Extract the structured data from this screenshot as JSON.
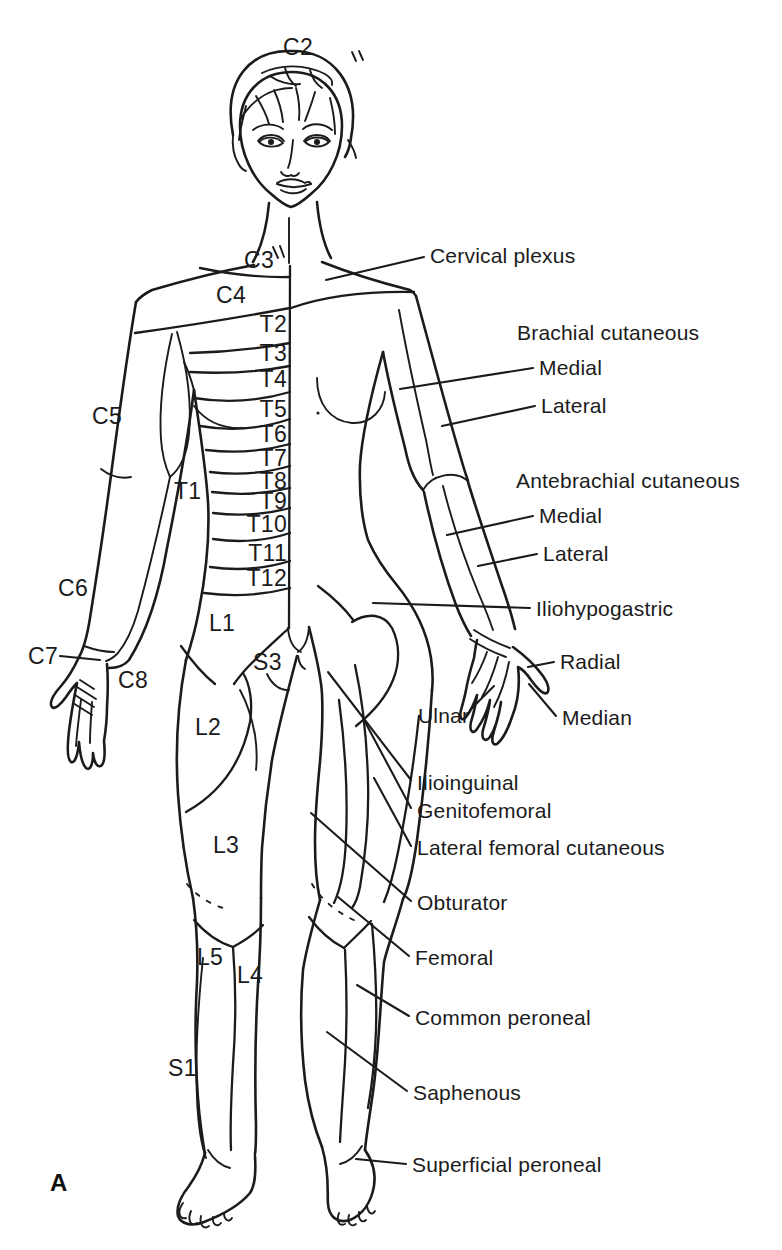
{
  "figure": {
    "panel_letter": "A",
    "dermatomes": {
      "c2": "C2",
      "c3": "C3",
      "c4": "C4",
      "c5": "C5",
      "c6": "C6",
      "c7": "C7",
      "c8": "C8",
      "t1": "T1",
      "t2": "T2",
      "t3": "T3",
      "t4": "T4",
      "t5": "T5",
      "t6": "T6",
      "t7": "T7",
      "t8": "T8",
      "t9": "T9",
      "t10": "T10",
      "t11": "T11",
      "t12": "T12",
      "l1": "L1",
      "l2": "L2",
      "l3": "L3",
      "l4": "L4",
      "l5": "L5",
      "s1": "S1",
      "s3": "S3"
    },
    "nerves": {
      "cervical_plexus": "Cervical plexus",
      "brachial_cutaneous_heading": "Brachial cutaneous",
      "brachial_medial": "Medial",
      "brachial_lateral": "Lateral",
      "antebrachial_cutaneous_heading": "Antebrachial cutaneous",
      "antebrachial_medial": "Medial",
      "antebrachial_lateral": "Lateral",
      "iliohypogastric": "Iliohypogastric",
      "radial": "Radial",
      "ulnar": "Ulnar",
      "median": "Median",
      "ilioinguinal": "Ilioinguinal",
      "genitofemoral": "Genitofemoral",
      "lateral_femoral_cutaneous": "Lateral femoral cutaneous",
      "obturator": "Obturator",
      "femoral": "Femoral",
      "common_peroneal": "Common peroneal",
      "saphenous": "Saphenous",
      "superficial_peroneal": "Superficial peroneal"
    }
  },
  "colors": {
    "ink": "#1b1b1b",
    "paper": "#ffffff"
  }
}
